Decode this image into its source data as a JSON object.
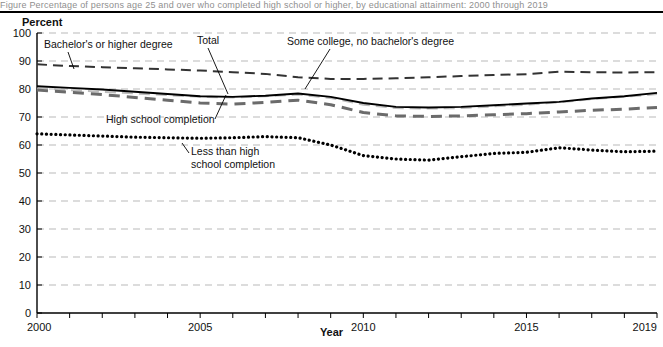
{
  "figure": {
    "top_note": "Figure  Percentage of persons age 25 and over who completed high school or higher, by educational attainment: 2000 through 2019",
    "y_axis_title": "Percent",
    "x_axis_title": "Year"
  },
  "annotations": {
    "bachelors": "Bachelor's or higher degree",
    "total": "Total",
    "some_college": "Some college, no bachelor's degree",
    "high_school": "High school completion",
    "less_than_hs_line1": "Less than high",
    "less_than_hs_line2": "school completion"
  },
  "colors": {
    "axis": "#000000",
    "grid": "#b9b9b9",
    "some_college": "#000000",
    "bachelors": "#333333",
    "high_school": "#6b6b6b",
    "total": "#bdbdbd",
    "less_than_hs": "#000000"
  },
  "chart_data": {
    "type": "line",
    "title": "",
    "xlabel": "Year",
    "ylabel": "Percent",
    "xlim": [
      2000,
      2019
    ],
    "ylim": [
      0,
      100
    ],
    "ytick_step": 10,
    "grid": true,
    "legend": "annotated-inline",
    "x": [
      2000,
      2001,
      2002,
      2003,
      2004,
      2005,
      2006,
      2007,
      2008,
      2009,
      2010,
      2011,
      2012,
      2013,
      2014,
      2015,
      2016,
      2017,
      2018,
      2019
    ],
    "xticks": [
      2000,
      2005,
      2010,
      2015,
      2019
    ],
    "yticks": [
      0,
      10,
      20,
      30,
      40,
      50,
      60,
      70,
      80,
      90,
      100
    ],
    "series": [
      {
        "name": "Bachelor's or higher degree",
        "style": "dashed",
        "values": [
          88.8,
          88.2,
          87.8,
          87.4,
          87.0,
          86.6,
          86.0,
          85.4,
          84.2,
          83.6,
          83.6,
          83.8,
          84.2,
          84.6,
          85.0,
          85.3,
          86.2,
          86.0,
          85.9,
          86.0
        ]
      },
      {
        "name": "Some college, no bachelor's degree",
        "style": "solid",
        "values": [
          81.0,
          80.4,
          79.8,
          79.0,
          78.2,
          77.4,
          77.2,
          77.6,
          78.4,
          77.2,
          75.0,
          73.6,
          73.4,
          73.6,
          74.2,
          74.8,
          75.4,
          76.6,
          77.4,
          78.6
        ]
      },
      {
        "name": "Total",
        "style": "dashed-light",
        "values": [
          80.2,
          79.6,
          79.0,
          78.4,
          77.8,
          77.2,
          77.0,
          77.4,
          78.0,
          76.8,
          74.4,
          73.2,
          73.0,
          73.2,
          73.8,
          74.4,
          75.2,
          76.4,
          77.2,
          78.2
        ]
      },
      {
        "name": "High school completion",
        "style": "dashed-heavy",
        "values": [
          79.6,
          78.8,
          78.0,
          77.0,
          76.0,
          75.0,
          74.6,
          75.2,
          76.0,
          74.4,
          71.6,
          70.4,
          70.2,
          70.4,
          70.8,
          71.2,
          71.8,
          72.4,
          72.8,
          73.4
        ]
      },
      {
        "name": "Less than high school completion",
        "style": "dotted",
        "values": [
          64.0,
          63.6,
          63.2,
          62.8,
          62.6,
          62.4,
          62.6,
          63.0,
          62.6,
          60.0,
          56.2,
          55.0,
          54.6,
          55.8,
          57.0,
          57.4,
          59.0,
          58.2,
          57.6,
          57.8
        ]
      }
    ]
  }
}
